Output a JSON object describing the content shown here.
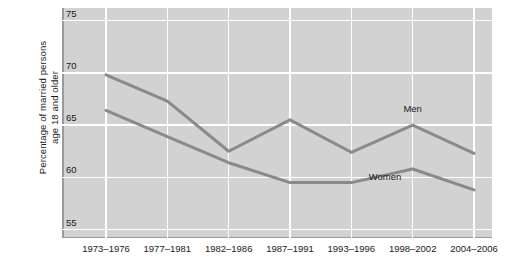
{
  "chart_data": {
    "type": "line",
    "title": "",
    "xlabel": "",
    "ylabel": "Percentage of married persons\nage 18 and older",
    "categories": [
      "1973–1976",
      "1977–1981",
      "1982–1986",
      "1987–1991",
      "1993–1996",
      "1998–2002",
      "2004–2006"
    ],
    "series": [
      {
        "name": "Men",
        "values": [
          69.8,
          67.3,
          62.5,
          65.5,
          62.4,
          65.0,
          62.3
        ]
      },
      {
        "name": "Women",
        "values": [
          66.4,
          63.9,
          61.4,
          59.5,
          59.5,
          60.8,
          58.8
        ]
      }
    ],
    "yticks": [
      75,
      70,
      65,
      60,
      55
    ],
    "ylim": [
      54.2,
      76.2
    ],
    "grid": true,
    "legend_position": "inline-annotation",
    "annotations": [
      {
        "text": "Men",
        "category_index": 5,
        "value": 66.6
      },
      {
        "text": "Women",
        "category_index": 4.55,
        "value": 60.1
      }
    ],
    "colors": {
      "line": "#8a8a8a",
      "plot_background": "#d2d2d2",
      "gridline": "#ffffff",
      "axis": "#9a9a9a",
      "text": "#1a1a1a"
    }
  }
}
